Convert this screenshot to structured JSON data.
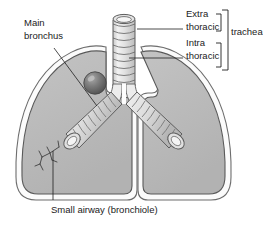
{
  "figure": {
    "background_color": "#ffffff",
    "labels": {
      "main_bronchus_line1": "Main",
      "main_bronchus_line2": "bronchus",
      "extra_thoracic_line1": "Extra",
      "extra_thoracic_line2": "thoracic",
      "intra_thoracic_line1": "Intra",
      "intra_thoracic_line2": "thoracic",
      "trachea": "trachea",
      "small_airway": "Small airway (bronchiole)"
    },
    "parts": {
      "trachea_name": "trachea",
      "left_lung_name": "lung",
      "right_lung_name": "lung",
      "carina_name": "carina",
      "left_main_bronchus_name": "main bronchus",
      "right_main_bronchus_name": "main bronchus",
      "bronchiole_name": "bronchiole",
      "nodule_name": "nodule"
    },
    "colors": {
      "lung_fill": "#b9b9b9",
      "lung_outline": "#4a4a4a",
      "airway_fill": "#e8e8e8",
      "airway_outline": "#5a5a5a",
      "nodule_fill": "#6e6e6e",
      "text": "#1b1b1b",
      "background": "#ffffff"
    },
    "trachea_ring_count": 9
  }
}
